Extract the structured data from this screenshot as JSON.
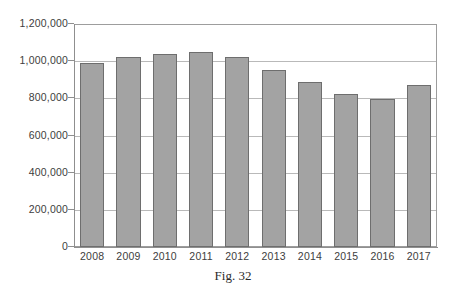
{
  "caption": "Fig. 32",
  "chart_data": {
    "type": "bar",
    "title": "",
    "xlabel": "",
    "ylabel": "",
    "categories": [
      "2008",
      "2009",
      "2010",
      "2011",
      "2012",
      "2013",
      "2014",
      "2015",
      "2016",
      "2017"
    ],
    "values": [
      988000,
      1020000,
      1038000,
      1052000,
      1025000,
      955000,
      886000,
      823000,
      798000,
      872000
    ],
    "ylim": [
      0,
      1200000
    ],
    "ytick_values": [
      0,
      200000,
      400000,
      600000,
      800000,
      1000000,
      1200000
    ],
    "ytick_labels": [
      "0",
      "200,000",
      "400,000",
      "600,000",
      "800,000",
      "1,000,000",
      "1,200,000"
    ],
    "grid": true,
    "legend": "none",
    "bar_color": "#a3a3a3",
    "bar_border_color": "#6e6e6e",
    "gridline_color": "#b9b9b9",
    "axis_color": "#8f8f8f",
    "background": "#ffffff"
  }
}
